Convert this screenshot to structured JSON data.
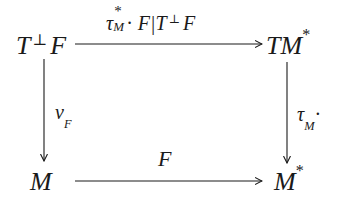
{
  "diagram": {
    "type": "commutative-square",
    "nodes": {
      "top_left": {
        "base": "T",
        "perp": "⊥",
        "tail": "F"
      },
      "top_right": {
        "base": "TM",
        "sup": "*"
      },
      "bottom_left": {
        "base": "M"
      },
      "bottom_right": {
        "base": "M",
        "sup": "*"
      }
    },
    "arrows": {
      "top": {
        "from": "T⊥F",
        "to": "TM*",
        "label": {
          "tau": "τ",
          "sup": "*",
          "sub": "M",
          "dot": "·",
          "rest_a": " F|T",
          "perp": "⊥",
          "rest_b": "F"
        }
      },
      "left": {
        "from": "T⊥F",
        "to": "M",
        "label": {
          "base": "v",
          "sub": "F"
        }
      },
      "right": {
        "from": "TM*",
        "to": "M*",
        "label": {
          "base": "τ",
          "sub": "M",
          "dot": "·"
        }
      },
      "bottom": {
        "from": "M",
        "to": "M*",
        "label": {
          "base": "F"
        }
      }
    },
    "colors": {
      "ink": "#1a1a1a",
      "background": "#ffffff"
    }
  }
}
